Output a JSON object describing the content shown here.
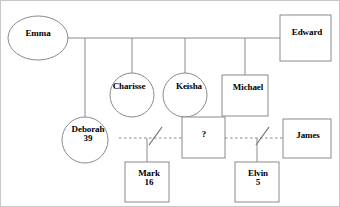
{
  "diagram": {
    "type": "genogram",
    "stroke_color": "#8a8a8a",
    "text_color": "#000000",
    "background_color": "#ffffff",
    "border_color": "#c8c8c8"
  },
  "people": [
    {
      "id": "emma",
      "name": "Emma",
      "age": "",
      "shape": "ellipse",
      "gender": "female",
      "generation": 1
    },
    {
      "id": "edward",
      "name": "Edward",
      "age": "",
      "shape": "square",
      "gender": "male",
      "generation": 1
    },
    {
      "id": "deborah",
      "name": "Deborah",
      "age": "39",
      "shape": "circle",
      "gender": "female",
      "generation": 2
    },
    {
      "id": "charisse",
      "name": "Charisse",
      "age": "",
      "shape": "circle",
      "gender": "female",
      "generation": 2
    },
    {
      "id": "keisha",
      "name": "Keisha",
      "age": "",
      "shape": "circle",
      "gender": "female",
      "generation": 2
    },
    {
      "id": "michael",
      "name": "Michael",
      "age": "",
      "shape": "square",
      "gender": "male",
      "generation": 2
    },
    {
      "id": "unknown",
      "name": "?",
      "age": "",
      "shape": "square",
      "gender": "male",
      "generation": 2
    },
    {
      "id": "james",
      "name": "James",
      "age": "",
      "shape": "square",
      "gender": "male",
      "generation": 2
    },
    {
      "id": "mark",
      "name": "Mark",
      "age": "16",
      "shape": "square",
      "gender": "male",
      "generation": 3
    },
    {
      "id": "elvin",
      "name": "Elvin",
      "age": "5",
      "shape": "square",
      "gender": "male",
      "generation": 3
    }
  ],
  "relationships": [
    {
      "id": "emma-edward",
      "from": "emma",
      "to": "edward",
      "line": "solid",
      "status": "married",
      "slash": "none"
    },
    {
      "id": "deborah-unknown",
      "from": "deborah",
      "to": "unknown",
      "line": "dashed",
      "status": "separated",
      "slash": "single"
    },
    {
      "id": "unknown-james",
      "from": "unknown",
      "to": "james",
      "line": "dashed",
      "status": "separated",
      "slash": "single"
    }
  ],
  "children_links": [
    {
      "parents": "emma-edward",
      "child": "deborah"
    },
    {
      "parents": "emma-edward",
      "child": "charisse"
    },
    {
      "parents": "emma-edward",
      "child": "keisha"
    },
    {
      "parents": "emma-edward",
      "child": "michael"
    },
    {
      "parents": "deborah-unknown",
      "child": "mark"
    },
    {
      "parents": "unknown-james",
      "child": "elvin"
    }
  ],
  "labels": {
    "emma": "Emma",
    "edward": "Edward",
    "charisse": "Charisse",
    "keisha": "Keisha",
    "michael": "Michael",
    "deborah_name": "Deborah",
    "deborah_age": "39",
    "unknown": "?",
    "james": "James",
    "mark_name": "Mark",
    "mark_age": "16",
    "elvin_name": "Elvin",
    "elvin_age": "5"
  }
}
